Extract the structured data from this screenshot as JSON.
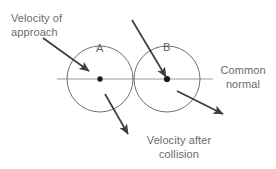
{
  "diagram": {
    "background_color": "#ffffff",
    "stroke_color": "#4a4a4a",
    "circle_color": "#6e6e6e",
    "normal_line_color": "#9a9a9a",
    "text_color": "#6b6b6b",
    "bodies": [
      {
        "id": "A",
        "label": "A",
        "cx": 100,
        "cy": 79,
        "r": 33
      },
      {
        "id": "B",
        "label": "B",
        "cx": 167,
        "cy": 79,
        "r": 33
      }
    ],
    "normal_line": {
      "x1": 57,
      "y1": 79,
      "x2": 213,
      "y2": 79
    },
    "arrows": [
      {
        "name": "velocity-of-approach-a",
        "x1": 43,
        "y1": 38,
        "x2": 89,
        "y2": 71
      },
      {
        "name": "velocity-of-approach-b",
        "x1": 132,
        "y1": 20,
        "x2": 166,
        "y2": 77
      },
      {
        "name": "velocity-after-collision-a",
        "x1": 105,
        "y1": 94,
        "x2": 128,
        "y2": 134
      },
      {
        "name": "velocity-after-collision-b",
        "x1": 177,
        "y1": 91,
        "x2": 223,
        "y2": 114
      }
    ],
    "labels": {
      "velocity_of_approach": "Velocity of\napproach",
      "common_normal": "Common\nnormal",
      "velocity_after_collision": "Velocity after\ncollision",
      "body_a": "A",
      "body_b": "B"
    }
  }
}
